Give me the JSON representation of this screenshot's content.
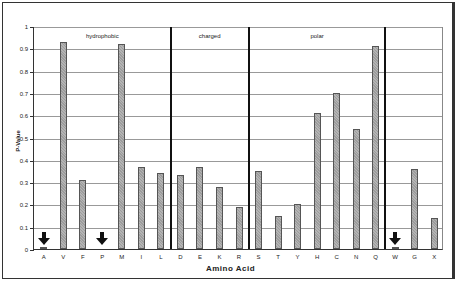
{
  "chart_data": {
    "type": "bar",
    "title": "",
    "xlabel": "Amino Acid",
    "ylabel": "P-Value",
    "ylim": [
      0,
      1
    ],
    "yticks": [
      "0",
      "0.1",
      "0.2",
      "0.3",
      "0.4",
      "0.5",
      "0.6",
      "0.7",
      "0.8",
      "0.9",
      "1"
    ],
    "grid": true,
    "categories": [
      "A",
      "V",
      "F",
      "P",
      "M",
      "I",
      "L",
      "D",
      "E",
      "K",
      "R",
      "S",
      "T",
      "Y",
      "H",
      "C",
      "N",
      "Q",
      "W",
      "G",
      "X"
    ],
    "values": [
      0.01,
      0.93,
      0.31,
      0.0,
      0.92,
      0.37,
      0.34,
      0.33,
      0.37,
      0.28,
      0.19,
      0.35,
      0.15,
      0.2,
      0.61,
      0.7,
      0.54,
      0.91,
      0.01,
      0.36,
      0.14
    ],
    "groups": [
      {
        "label": "hydrophobic",
        "members": [
          "A",
          "V",
          "F",
          "P",
          "M",
          "I",
          "L"
        ]
      },
      {
        "label": "charged",
        "members": [
          "D",
          "E",
          "K",
          "R"
        ]
      },
      {
        "label": "polar",
        "members": [
          "S",
          "T",
          "Y",
          "H",
          "C",
          "N",
          "Q"
        ]
      },
      {
        "label": "",
        "members": [
          "W",
          "G",
          "X"
        ]
      }
    ],
    "annotations": [
      {
        "type": "arrow-down",
        "at": "A"
      },
      {
        "type": "arrow-down",
        "at": "P"
      },
      {
        "type": "arrow-down",
        "at": "W"
      }
    ]
  }
}
